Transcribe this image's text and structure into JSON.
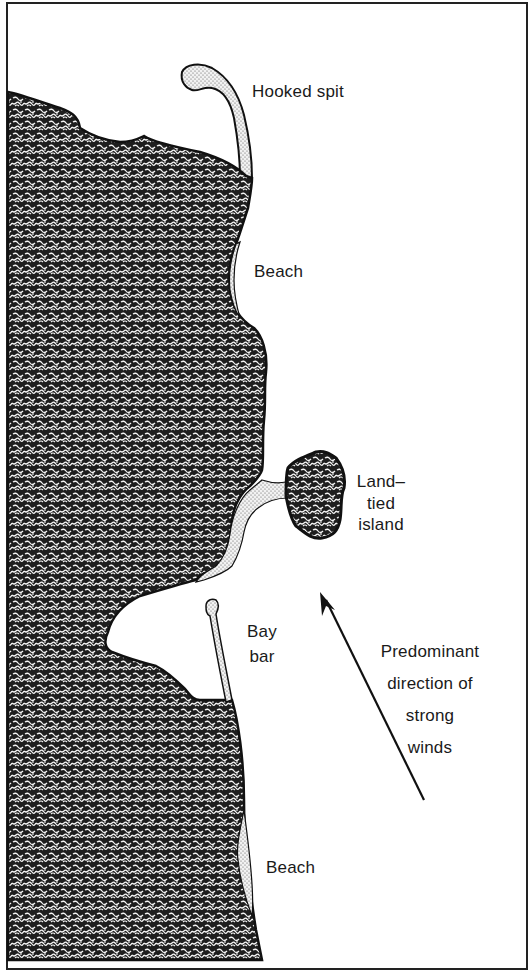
{
  "diagram": {
    "colors": {
      "land": "#1c1c1c",
      "sand": "#cfcfcf",
      "water": "#ffffff",
      "outline": "#111111"
    },
    "labels": {
      "hooked_spit": "Hooked spit",
      "beach_upper": "Beach",
      "land_tied_island_line1": "Land–",
      "land_tied_island_line2": "tied",
      "land_tied_island_line3": "island",
      "bay_bar_line1": "Bay",
      "bay_bar_line2": "bar",
      "wind_line1": "Predominant",
      "wind_line2": "direction of",
      "wind_line3": "strong",
      "wind_line4": "winds",
      "beach_lower": "Beach"
    },
    "legend_semantics": {
      "dark_textured_area": "land",
      "stippled_area": "sand deposits",
      "white_area": "water"
    },
    "arrow": {
      "meaning": "Predominant direction of strong winds",
      "direction": "north-northwest"
    }
  }
}
